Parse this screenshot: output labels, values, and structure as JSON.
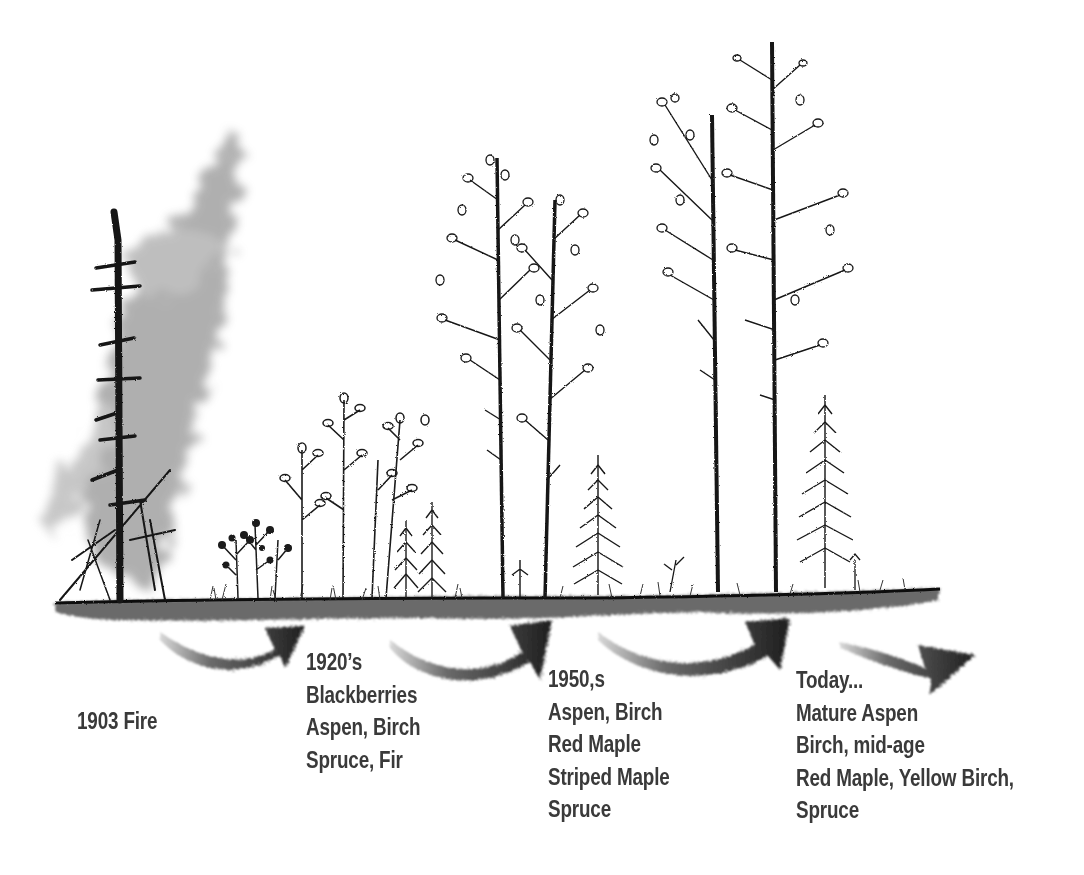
{
  "diagram": {
    "type": "forest-succession-timeline",
    "colors": {
      "ink": "#1c1c1c",
      "text": "#3a3a3a",
      "smoke": "#8a8a8a",
      "background": "#ffffff"
    },
    "stages": [
      {
        "id": "fire",
        "title": "1903 Fire",
        "lines": [
          "1903 Fire"
        ],
        "illustration": "burnt-snag-with-smoke"
      },
      {
        "id": "1920s",
        "title": "1920’s",
        "lines": [
          "1920’s",
          "Blackberries",
          "Aspen, Birch",
          "Spruce, Fir"
        ],
        "illustration": "shrubs-saplings-young-conifers"
      },
      {
        "id": "1950s",
        "title": "1950,s",
        "lines": [
          "1950,s",
          "Aspen, Birch",
          "Red Maple",
          "Striped Maple",
          "Spruce"
        ],
        "illustration": "young-aspen-birch-with-spruce"
      },
      {
        "id": "today",
        "title": "Today...",
        "lines": [
          "Today...",
          "Mature Aspen",
          "Birch, mid-age",
          "Red Maple, Yellow Birch,",
          "Spruce"
        ],
        "illustration": "mature-aspen-birch-with-spruce"
      }
    ],
    "arrows": [
      {
        "from": "fire",
        "to": "1920s",
        "icon": "curved-arrow-right"
      },
      {
        "from": "1920s",
        "to": "1950s",
        "icon": "curved-arrow-right"
      },
      {
        "from": "1950s",
        "to": "today",
        "icon": "curved-arrow-right"
      },
      {
        "from": "today",
        "to": "future",
        "icon": "arrow-right"
      }
    ]
  }
}
